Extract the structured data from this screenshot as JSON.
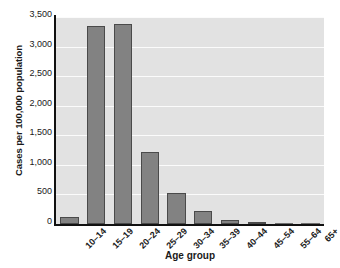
{
  "chart_data": {
    "type": "bar",
    "title": "",
    "subtitle": "",
    "xlabel": "Age group",
    "ylabel": "Cases per 100,000 population",
    "categories": [
      "10–14",
      "15–19",
      "20–24",
      "25–29",
      "30–34",
      "35–39",
      "40–44",
      "45–54",
      "55–64",
      "65+"
    ],
    "values": [
      120,
      3350,
      3390,
      1220,
      530,
      215,
      75,
      35,
      8,
      2
    ],
    "series": [
      {
        "name": "Cases per 100,000 population",
        "values": [
          120,
          3350,
          3390,
          1220,
          530,
          215,
          75,
          35,
          8,
          2
        ]
      }
    ],
    "ylim": [
      0,
      3500
    ],
    "yticks": [
      0,
      500,
      1000,
      1500,
      2000,
      2500,
      3000,
      3500
    ],
    "ytick_labels": [
      "0",
      "500",
      "1,000",
      "1,500",
      "2,000",
      "2,500",
      "3,000",
      "3,500"
    ],
    "grid": "horizontal",
    "legend": "none",
    "xtick_rotation": -45,
    "colors": {
      "bar_fill": "#828282",
      "bar_edge": "#4a4a4a",
      "plot_background": "#e2e2e2",
      "gridline": "#fbfbfb",
      "axis_line": "#111111",
      "text": "#1a1a1a",
      "figure_background": "#ffffff"
    }
  }
}
